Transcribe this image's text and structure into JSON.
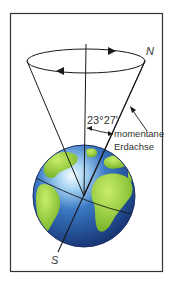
{
  "diagram": {
    "angle_label": "23°27'",
    "axis_label_line1": "momentane",
    "axis_label_line2": "Erdachse",
    "north_label": "N",
    "south_label": "S"
  },
  "colors": {
    "frame": "#333333",
    "line": "#1a1a1a",
    "ocean_dark": "#1e3f8f",
    "ocean_light": "#dff1ff",
    "land": "#9fd33a"
  }
}
